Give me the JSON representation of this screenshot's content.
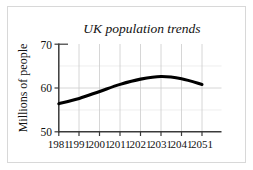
{
  "chart_data": {
    "type": "line",
    "title": "UK population trends",
    "xlabel": "",
    "ylabel": "Millions of people",
    "x": [
      1981,
      1991,
      2001,
      2011,
      2021,
      2031,
      2041,
      2051
    ],
    "xtick_labels": [
      "1981",
      "1991",
      "2001",
      "2011",
      "2021",
      "2031",
      "2041",
      "2051"
    ],
    "values": [
      56.4,
      57.6,
      59.2,
      60.8,
      62.0,
      62.6,
      62.1,
      60.8
    ],
    "series": [
      {
        "name": "UK population",
        "values": [
          56.4,
          57.6,
          59.2,
          60.8,
          62.0,
          62.6,
          62.1,
          60.8
        ]
      }
    ],
    "ylim": [
      50,
      70
    ],
    "ytick_labels": [
      "50",
      "60",
      "70"
    ],
    "yticks": [
      50,
      60,
      70
    ],
    "xlim": [
      1981,
      2051
    ],
    "grid": true,
    "legend": "none",
    "line_color": "#000000",
    "grid_color": "#cccccc",
    "axis_color": "#4d4d4d",
    "background_color": "#ffffff"
  }
}
